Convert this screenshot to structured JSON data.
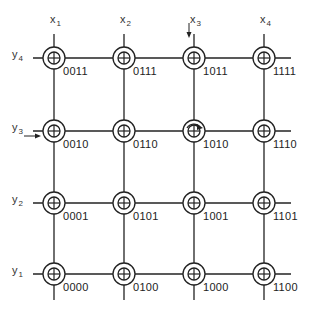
{
  "diagram": {
    "type": "core-memory-grid",
    "columns": [
      {
        "label": "x",
        "sub": "1",
        "x": 54
      },
      {
        "label": "x",
        "sub": "2",
        "x": 124
      },
      {
        "label": "x",
        "sub": "3",
        "x": 194
      },
      {
        "label": "x",
        "sub": "4",
        "x": 264
      }
    ],
    "rows": [
      {
        "label": "y",
        "sub": "4",
        "y": 58
      },
      {
        "label": "y",
        "sub": "3",
        "y": 131
      },
      {
        "label": "y",
        "sub": "2",
        "y": 203
      },
      {
        "label": "y",
        "sub": "1",
        "y": 274
      }
    ],
    "nodes": [
      [
        "0011",
        "0111",
        "1011",
        "1111"
      ],
      [
        "0010",
        "0110",
        "1010",
        "1110"
      ],
      [
        "0001",
        "0101",
        "1001",
        "1101"
      ],
      [
        "0000",
        "0100",
        "1000",
        "1100"
      ]
    ],
    "annotations": {
      "x3_arrow": "down-arrow on x3 line",
      "y3_arrow": "right-arrow on y3 line",
      "selected_node": "1010",
      "selected_node_marker": "curved-arrow"
    },
    "colors": {
      "line": "#222222",
      "background": "#ffffff"
    }
  }
}
